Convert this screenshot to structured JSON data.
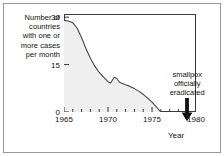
{
  "chart_data": {
    "type": "area",
    "title": "",
    "subtitle": "",
    "xlabel": "Year",
    "ylabel": "Number of countries with one or more cases per month",
    "ylabel_lines": [
      "Number of",
      "countries",
      "with one or",
      "more cases",
      "per month"
    ],
    "xlim": [
      1965,
      1980
    ],
    "ylim": [
      0,
      31
    ],
    "yticks": [
      0,
      15,
      30
    ],
    "ytick_labels": [
      "0",
      "15",
      "30"
    ],
    "xticks": [
      1965,
      1970,
      1975,
      1980
    ],
    "xtick_labels": [
      "1965",
      "1970",
      "1975",
      "1980"
    ],
    "x_minor_tick_step": 1,
    "grid": false,
    "legend": false,
    "legend_position": "none",
    "line_color": "#444444",
    "fill_color": "#efefef",
    "axis_color": "#3b3b3b",
    "text_color": "#111111",
    "series": [
      {
        "name": "Countries with one or more smallpox cases per month",
        "x": [
          1965,
          1965.5,
          1966,
          1966.5,
          1967,
          1967.5,
          1968,
          1968.5,
          1969,
          1969.5,
          1970,
          1970.3,
          1970.7,
          1971,
          1971.3,
          1972,
          1972.5,
          1973,
          1973.5,
          1974,
          1974.5,
          1975,
          1975.5,
          1976
        ],
        "values": [
          29,
          28.8,
          28.2,
          26.5,
          23.5,
          20,
          17,
          14.5,
          12.5,
          11,
          9.6,
          9.2,
          11,
          10.6,
          9.4,
          8.6,
          8.1,
          7.4,
          6.6,
          5.6,
          4.4,
          3.1,
          1.6,
          0
        ]
      }
    ],
    "annotations": [
      {
        "text": "smallpox officially eradicated",
        "lines": [
          "smallpox",
          "officially",
          "eradicated"
        ],
        "x": 1979,
        "arrow": "down-arrow"
      }
    ]
  }
}
